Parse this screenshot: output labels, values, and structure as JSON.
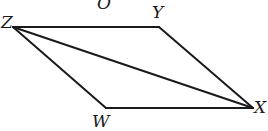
{
  "diagram": {
    "type": "parallelogram-with-diagonal",
    "vertices": [
      {
        "id": "Z",
        "label": "Z",
        "x": 13,
        "y": 27,
        "label_x": 1,
        "label_y": 28
      },
      {
        "id": "Y",
        "label": "Y",
        "x": 159,
        "y": 27,
        "label_x": 152,
        "label_y": 18
      },
      {
        "id": "X",
        "label": "X",
        "x": 253,
        "y": 108,
        "label_x": 254,
        "label_y": 113
      },
      {
        "id": "W",
        "label": "W",
        "x": 106,
        "y": 108,
        "label_x": 92,
        "label_y": 127
      }
    ],
    "extra_labels": [
      {
        "id": "O",
        "label": "O",
        "x": 97,
        "y": 9
      }
    ],
    "edges": [
      {
        "from": "Z",
        "to": "Y",
        "name": "segment-zy"
      },
      {
        "from": "Y",
        "to": "X",
        "name": "segment-yx"
      },
      {
        "from": "X",
        "to": "W",
        "name": "segment-xw"
      },
      {
        "from": "W",
        "to": "Z",
        "name": "segment-wz"
      },
      {
        "from": "Z",
        "to": "X",
        "name": "diagonal-zx"
      }
    ],
    "stroke_color": "#1a1a1a",
    "background_color": "#ffffff"
  }
}
